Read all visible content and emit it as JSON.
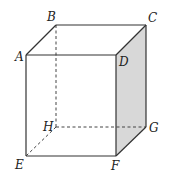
{
  "figure": {
    "type": "cube",
    "shaded_face": "DCGF",
    "shade_color": "#d8d8d8",
    "line_color": "#333333",
    "vertices": {
      "A": {
        "label": "A",
        "x": 26,
        "y": 55,
        "lx": 15,
        "ly": 61
      },
      "B": {
        "label": "B",
        "x": 56,
        "y": 25,
        "lx": 47,
        "ly": 21
      },
      "C": {
        "label": "C",
        "x": 146,
        "y": 25,
        "lx": 148,
        "ly": 22
      },
      "D": {
        "label": "D",
        "x": 116,
        "y": 55,
        "lx": 119,
        "ly": 66
      },
      "E": {
        "label": "E",
        "x": 26,
        "y": 156,
        "lx": 15,
        "ly": 169
      },
      "F": {
        "label": "F",
        "x": 116,
        "y": 156,
        "lx": 111,
        "ly": 170
      },
      "G": {
        "label": "G",
        "x": 146,
        "y": 127,
        "lx": 149,
        "ly": 132
      },
      "H": {
        "label": "H",
        "x": 56,
        "y": 127,
        "lx": 43,
        "ly": 131
      }
    },
    "solid_edges": [
      "AB",
      "BC",
      "CD",
      "DA",
      "AE",
      "EF",
      "FD",
      "CG",
      "GF"
    ],
    "hidden_edges": [
      "BH",
      "HE",
      "HG"
    ]
  }
}
